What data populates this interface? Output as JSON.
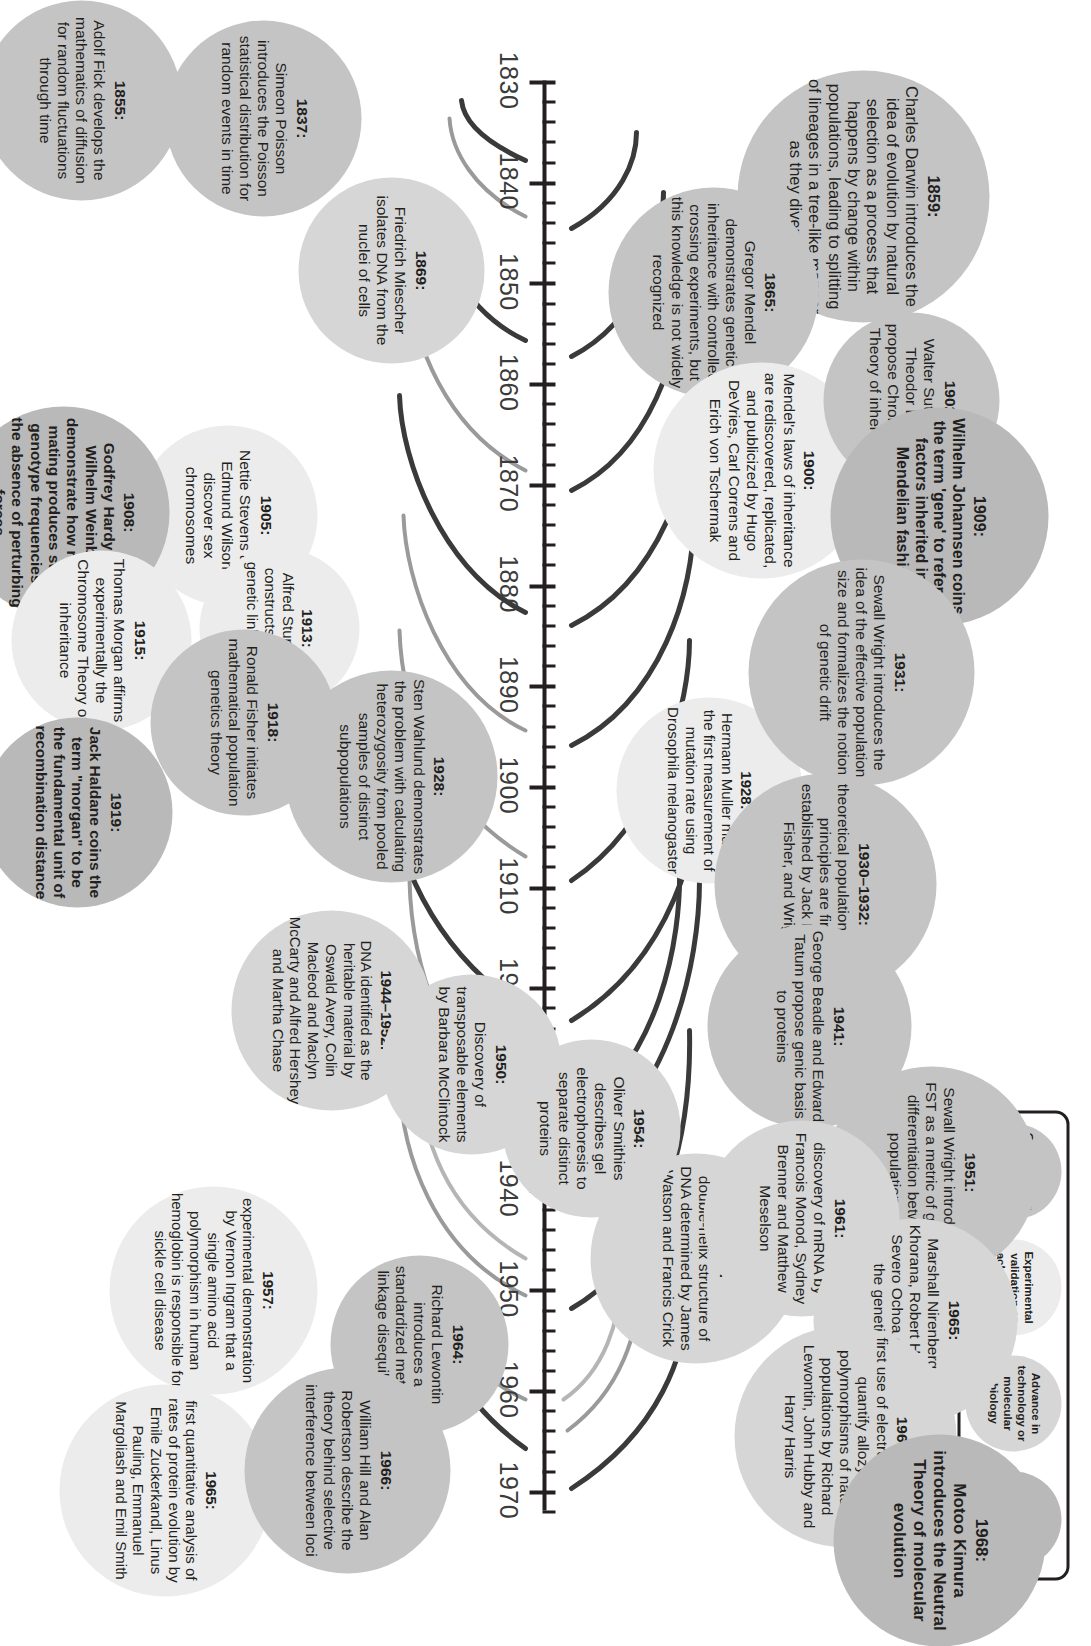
{
  "figure": {
    "type": "timeline",
    "title": "",
    "orientation": "vertical (rotated landscape figure)"
  },
  "axis": {
    "start_year": 1830,
    "end_year": 1972,
    "major_step": 10,
    "minor_step": 2,
    "year_labels": [
      "1830",
      "1840",
      "1850",
      "1860",
      "1870",
      "1880",
      "1890",
      "1900",
      "1910",
      "1920",
      "1930",
      "1940",
      "1950",
      "1960",
      "1970"
    ]
  },
  "legend": {
    "items": [
      {
        "label": "Conceptual or theoretical advance",
        "category": "conceptual",
        "color": "#c4c4c4"
      },
      {
        "label": "Experimental validation or achievement",
        "category": "experimental",
        "color": "#ececec"
      },
      {
        "label": "Advance in technology or molecular biology",
        "category": "technology",
        "color": "#d6d6d6"
      },
      {
        "label": "Historical milestone",
        "category": "historical",
        "color": "#b9b9b9"
      }
    ]
  },
  "events": [
    {
      "year": 1837,
      "label": "1837:",
      "text": "Simeon Poisson introduces the Poisson statistical distribution for random events in time",
      "category": "conceptual"
    },
    {
      "year": 1855,
      "label": "1855:",
      "text": "Adolf Fick develops the mathematics of diffusion for random fluctuations through time",
      "category": "conceptual"
    },
    {
      "year": 1859,
      "label": "1859:",
      "text": "Charles Darwin introduces the idea of evolution by natural selection as a process that happens by change within populations, leading to splitting of lineages in a tree-like manner as they diverge",
      "category": "conceptual"
    },
    {
      "year": 1865,
      "label": "1865:",
      "text": "Gregor Mendel demonstrates genetic inheritance with controlled crossing experiments, but this knowledge is not widely recognized",
      "category": "conceptual"
    },
    {
      "year": 1869,
      "label": "1869:",
      "text": "Friedrich Miescher isolates DNA from the nuclei of cells",
      "category": "technology"
    },
    {
      "year": 1900,
      "label": "1900:",
      "text": "Mendel's laws of inheritance are rediscovered, replicated, and publicized by Hugo DeVries, Carl Correns and Erich von Tschermak",
      "category": "experimental"
    },
    {
      "year": 1902,
      "label": "1902:",
      "text": "Walter Sutton and Theodor Boveri propose Chromosome Theory of inheritance",
      "category": "conceptual"
    },
    {
      "year": 1905,
      "label": "1905:",
      "text": "Nettie Stevens and Edmund Wilson discover sex chromosomes",
      "category": "experimental"
    },
    {
      "year": 1908,
      "label": "1908:",
      "text": "Godfrey Hardy and Wilhelm Weinberg demonstrate how random mating produces stable genotype frequencies in the absence of perturbing forces",
      "category": "historical"
    },
    {
      "year": 1909,
      "label": "1909:",
      "text": "Wilhelm Johannsen coins the term 'gene' to refer to factors inherited in a Mendelian fashion",
      "category": "historical"
    },
    {
      "year": 1913,
      "label": "1913:",
      "text": "Alfred Sturtevant constructs the first genetic linkage map",
      "category": "experimental"
    },
    {
      "year": 1915,
      "label": "1915:",
      "text": "Thomas Morgan affirms experimentally the Chromosome Theory of inheritance",
      "category": "experimental"
    },
    {
      "year": 1918,
      "label": "1918:",
      "text": "Ronald Fisher initiates mathematical population genetics theory",
      "category": "conceptual"
    },
    {
      "year": 1919,
      "label": "1919:",
      "text": "Jack Haldane coins the term \"morgan\" to be the fundamental unit of recombination distance",
      "category": "historical"
    },
    {
      "year": 1928,
      "label": "1928:",
      "text": "Sten Wahlund demonstrates the problem with calculating heterozygosity from pooled samples of distinct subpopulations",
      "category": "conceptual"
    },
    {
      "year": 1928,
      "label": "1928:",
      "text": "Hermann Muller makes the first measurement of mutation rate using Drosophila melanogaster",
      "category": "experimental"
    },
    {
      "year": 1931,
      "label": "1931:",
      "text": "Sewall Wright introduces the idea of the effective population size and formalizes the notion of genetic drift",
      "category": "conceptual"
    },
    {
      "year": 1931,
      "label": "1930–1932:",
      "text": "theoretical population genetic principles are firmly established by Jack Haldane, Fisher, and Wright",
      "category": "conceptual"
    },
    {
      "year": 1941,
      "label": "1941:",
      "text": "George Beadle and Edward Tatum propose genic basis to proteins",
      "category": "conceptual"
    },
    {
      "year": 1944,
      "label": "1944–1952:",
      "text": "DNA identified as the heritable material by Oswald Avery, Colin Macleod and Maclyn McCarty and Alfred Hershey and Martha Chase",
      "category": "technology"
    },
    {
      "year": 1950,
      "label": "1950:",
      "text": "Discovery of transposable elements by Barbara McClintock",
      "category": "technology"
    },
    {
      "year": 1951,
      "label": "1951:",
      "text": "Sewall Wright introduces FST as a metric of genetic differentiation between populations",
      "category": "conceptual"
    },
    {
      "year": 1953,
      "label": "1953:",
      "text": "double-helix structure of DNA determined by James Watson and Francis Crick",
      "category": "technology"
    },
    {
      "year": 1954,
      "label": "1954:",
      "text": "Oliver Smithies describes gel electrophoresis to separate distinct proteins",
      "category": "technology"
    },
    {
      "year": 1957,
      "label": "1957:",
      "text": "experimental demonstration by Vernon Ingram that a single amino acid polymorphism in human hemoglobin is responsible for sickle cell disease",
      "category": "experimental"
    },
    {
      "year": 1961,
      "label": "1961:",
      "text": "discovery of mRNA by Francois Monod, Sydney Brenner and Matthew Meselson",
      "category": "technology"
    },
    {
      "year": 1964,
      "label": "1964:",
      "text": "Richard Lewontin introduces a standardized metric for linkage disequilibrium",
      "category": "conceptual"
    },
    {
      "year": 1965,
      "label": "1965:",
      "text": "Marshall Nirenberg, Har Khorana, Robert Holley and Severo Ochoa determine the genetic code",
      "category": "technology"
    },
    {
      "year": 1965,
      "label": "1965:",
      "text": "first quantitative analysis of rates of protein evolution by Emile Zuckerkandl, Linus Pauling, Emmanuel Margoliash and Emil Smith",
      "category": "experimental"
    },
    {
      "year": 1966,
      "label": "1966:",
      "text": "first use of electrophoresis to quantify allozyme polymorphisms of natural populations by Richard Lewontin, John Hubby and Harry Harris",
      "category": "technology"
    },
    {
      "year": 1966,
      "label": "1966:",
      "text": "William Hill and Alan Robertson describe the theory behind selective interference between loci",
      "category": "conceptual"
    },
    {
      "year": 1968,
      "label": "1968:",
      "text": "Motoo Kimura introduces the Neutral Theory of molecular evolution",
      "category": "historical"
    }
  ]
}
